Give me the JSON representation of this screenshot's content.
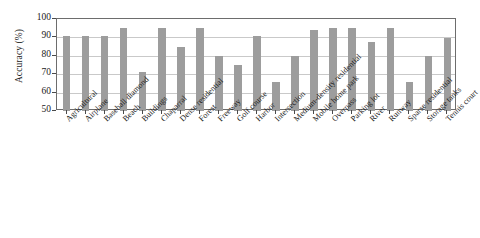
{
  "chart_data": {
    "type": "bar",
    "title": "",
    "xlabel": "",
    "ylabel": "Accuracy (%)",
    "ylim": [
      50,
      100
    ],
    "yticks": [
      50,
      60,
      70,
      80,
      90,
      100
    ],
    "ytick_labels": [
      "50",
      "60",
      "70",
      "80",
      "90",
      "100"
    ],
    "grid": true,
    "legend": "none",
    "bar_color": "#9d9d9d",
    "axis_color": "#6d6d6d",
    "grid_color": "#c9c9c9",
    "categories": [
      "Agricultural",
      "Airplane",
      "Baseball diamond",
      "Beach",
      "Buildings",
      "Chaparral",
      "Dense residential",
      "Forest",
      "Freeway",
      "Golf course",
      "Harbor",
      "Intersection",
      "Medium-density residential",
      "Mobile home park",
      "Overpass",
      "Parking lot",
      "River",
      "Runway",
      "Sparse residential",
      "Storage tanks",
      "Tennis court"
    ],
    "values": [
      90.5,
      90.5,
      90.5,
      95,
      71,
      95,
      85,
      95,
      80,
      75,
      90.5,
      66,
      80,
      94,
      95,
      95,
      87.5,
      95,
      66,
      80,
      89.5
    ]
  }
}
